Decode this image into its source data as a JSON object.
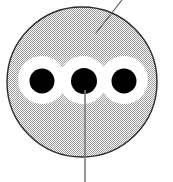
{
  "figure": {
    "width": 173,
    "height": 182,
    "background_color": "#ffffff"
  },
  "colors": {
    "outer_body_fill": "#dcdcdc",
    "outer_body_stroke": "#2b2b2b",
    "insulation_fill": "#ffffff",
    "core_fill": "#000000",
    "leader_line": "#555555",
    "halftone_dot": "#9a9a9a"
  },
  "shapes": {
    "outer_body": {
      "name": "outer-jacket-circle",
      "cx": 82,
      "cy": 82,
      "r": 75,
      "fill": "#dcdcdc",
      "stroke": "#2b2b2b",
      "stroke_width": 1.4,
      "pattern": "halftone-dither"
    },
    "insulation_circles": [
      {
        "name": "insulation-left",
        "cx": 42,
        "cy": 80,
        "r": 24,
        "fill": "#ffffff"
      },
      {
        "name": "insulation-middle",
        "cx": 83,
        "cy": 80,
        "r": 24,
        "fill": "#ffffff"
      },
      {
        "name": "insulation-right",
        "cx": 124,
        "cy": 80,
        "r": 24,
        "fill": "#ffffff"
      }
    ],
    "core_dots": [
      {
        "name": "core-left",
        "cx": 42,
        "cy": 81,
        "r": 12.5,
        "fill": "#000000"
      },
      {
        "name": "core-middle",
        "cx": 84,
        "cy": 81,
        "r": 13.0,
        "fill": "#000000"
      },
      {
        "name": "core-right",
        "cx": 124,
        "cy": 81,
        "r": 12.5,
        "fill": "#000000"
      }
    ]
  },
  "leader_lines": [
    {
      "name": "leader-line-jacket",
      "x1": 122,
      "y1": 0,
      "x2": 96,
      "y2": 33,
      "stroke": "#555555",
      "stroke_width": 1.1,
      "points_to": "outer-jacket-circle"
    },
    {
      "name": "leader-line-core",
      "x1": 85,
      "y1": 90,
      "x2": 85,
      "y2": 182,
      "stroke": "#7a7a7a",
      "stroke_width": 1.6,
      "points_to": "core-middle"
    }
  ],
  "labels": {
    "jacket_label": "",
    "core_label": ""
  }
}
